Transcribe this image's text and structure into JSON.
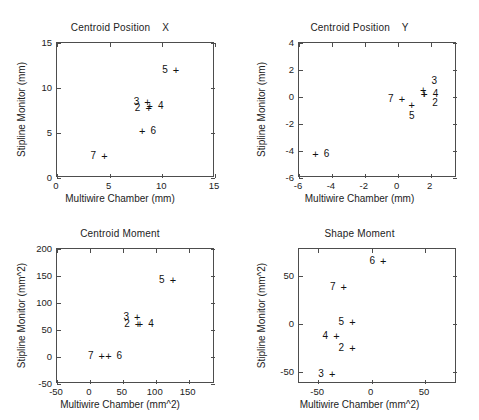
{
  "figure": {
    "title": "",
    "marker_glyph": "+",
    "axis_color": "#4d4d4d",
    "text_color": "#232323"
  },
  "chart_data": [
    {
      "type": "scatter",
      "id": "centroid-position-x",
      "title": "Centroid Position    X",
      "xlabel": "Multiwire Chamber (mm)",
      "ylabel": "Stipline Monitor (mm)",
      "xlim": [
        0,
        15
      ],
      "ylim": [
        0,
        15
      ],
      "xticks": [
        0,
        5,
        10,
        15
      ],
      "xticklabels": [
        "0",
        "5",
        "10",
        "15"
      ],
      "yticks": [
        0,
        5,
        10,
        15
      ],
      "yticklabels": [
        "0",
        "5",
        "10",
        "15"
      ],
      "grid": false,
      "legend": "none",
      "points": [
        {
          "label": "2",
          "x": 8.7,
          "y": 7.8,
          "label_pos": "left"
        },
        {
          "label": "3",
          "x": 8.6,
          "y": 8.5,
          "label_pos": "left"
        },
        {
          "label": "4",
          "x": 8.8,
          "y": 8.0,
          "label_pos": "right"
        },
        {
          "label": "5",
          "x": 11.3,
          "y": 12.0,
          "label_pos": "left"
        },
        {
          "label": "6",
          "x": 8.1,
          "y": 5.2,
          "label_pos": "right"
        },
        {
          "label": "7",
          "x": 4.5,
          "y": 2.5,
          "label_pos": "left"
        }
      ]
    },
    {
      "type": "scatter",
      "id": "centroid-position-y",
      "title": "Centroid Position    Y",
      "xlabel": "Multiwire Chamber (mm)",
      "ylabel": "Stipline Monitor (mm)",
      "xlim": [
        -6,
        3.6
      ],
      "ylim": [
        -6,
        4
      ],
      "xticks": [
        -6,
        -4,
        -2,
        0,
        2
      ],
      "xticklabels": [
        "-6",
        "-4",
        "-2",
        "0",
        "2"
      ],
      "yticks": [
        -6,
        -4,
        -2,
        0,
        2,
        4
      ],
      "yticklabels": [
        "-6",
        "-4",
        "-2",
        "0",
        "2",
        "4"
      ],
      "grid": false,
      "legend": "none",
      "points": [
        {
          "label": "2",
          "x": 1.6,
          "y": 0.25,
          "label_pos": "right-below"
        },
        {
          "label": "3",
          "x": 1.55,
          "y": 0.55,
          "label_pos": "right-above"
        },
        {
          "label": "4",
          "x": 1.62,
          "y": 0.25,
          "label_pos": "right"
        },
        {
          "label": "5",
          "x": 0.85,
          "y": -0.6,
          "label_pos": "below"
        },
        {
          "label": "6",
          "x": -5.0,
          "y": -4.2,
          "label_pos": "right"
        },
        {
          "label": "7",
          "x": 0.25,
          "y": -0.15,
          "label_pos": "left"
        }
      ]
    },
    {
      "type": "scatter",
      "id": "centroid-moment",
      "title": "Centroid Moment",
      "xlabel": "Multiwire Chamber (mm^2)",
      "ylabel": "Stipline Monitor (mm^2)",
      "xlim": [
        -50,
        190
      ],
      "ylim": [
        -50,
        200
      ],
      "xticks": [
        -50,
        0,
        50,
        100,
        150
      ],
      "xticklabels": [
        "-50",
        "0",
        "50",
        "100",
        "150"
      ],
      "yticks": [
        -50,
        0,
        50,
        100,
        150,
        200
      ],
      "yticklabels": [
        "-50",
        "0",
        "50",
        "100",
        "150",
        "200"
      ],
      "grid": false,
      "legend": "none",
      "points": [
        {
          "label": "2",
          "x": 73,
          "y": 62,
          "label_pos": "left"
        },
        {
          "label": "3",
          "x": 72,
          "y": 75,
          "label_pos": "left"
        },
        {
          "label": "4",
          "x": 76,
          "y": 62,
          "label_pos": "right"
        },
        {
          "label": "5",
          "x": 126,
          "y": 142,
          "label_pos": "left"
        },
        {
          "label": "6",
          "x": 28,
          "y": 2,
          "label_pos": "right"
        },
        {
          "label": "7",
          "x": 18,
          "y": 2,
          "label_pos": "left"
        }
      ]
    },
    {
      "type": "scatter",
      "id": "shape-moment",
      "title": "Shape Moment",
      "xlabel": "Multiwire Chamber (mm^2)",
      "ylabel": "Stipline Monitor (mm^2)",
      "xlim": [
        -68,
        80
      ],
      "ylim": [
        -62,
        78
      ],
      "xticks": [
        -50,
        0,
        50
      ],
      "xticklabels": [
        "-50",
        "0",
        "50"
      ],
      "yticks": [
        -50,
        0,
        50
      ],
      "yticklabels": [
        "-50",
        "0",
        "50"
      ],
      "grid": false,
      "legend": "none",
      "points": [
        {
          "label": "2",
          "x": -18,
          "y": -25,
          "label_pos": "left"
        },
        {
          "label": "3",
          "x": -37,
          "y": -52,
          "label_pos": "left"
        },
        {
          "label": "4",
          "x": -33,
          "y": -12,
          "label_pos": "left"
        },
        {
          "label": "5",
          "x": -18,
          "y": 2,
          "label_pos": "left"
        },
        {
          "label": "6",
          "x": 11,
          "y": 66,
          "label_pos": "left"
        },
        {
          "label": "7",
          "x": -26,
          "y": 39,
          "label_pos": "left"
        }
      ]
    }
  ]
}
